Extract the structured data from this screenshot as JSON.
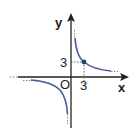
{
  "diagram": {
    "type": "function-graph",
    "function": "y = 9/x",
    "axes": {
      "x_label": "x",
      "y_label": "y",
      "origin_label": "O"
    },
    "ticks": {
      "x_tick": "3",
      "y_tick": "3"
    },
    "marked_point": {
      "x": 3,
      "y": 3
    },
    "colors": {
      "curve": "#4a5a9a",
      "axis": "#222222",
      "guide": "#777777",
      "point": "#2a3f7a"
    }
  }
}
